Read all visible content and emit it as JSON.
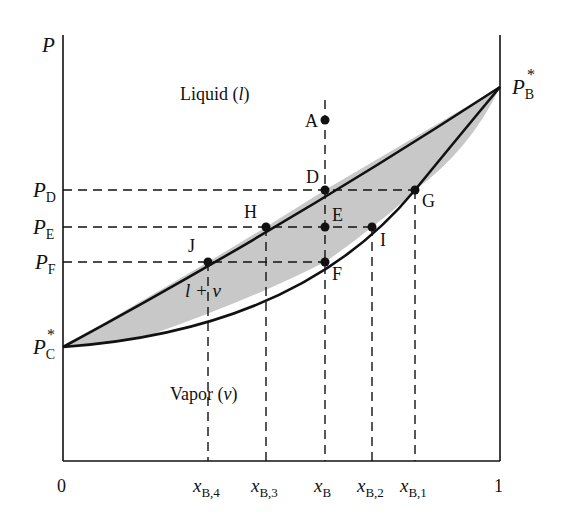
{
  "diagram": {
    "y_axis_label": "P",
    "x_axis_ticks": {
      "left": "0",
      "right": "1"
    },
    "pure_pressures": {
      "P_C_star": {
        "main": "P",
        "sub": "C",
        "sup": "*"
      },
      "P_B_star": {
        "main": "P",
        "sub": "B",
        "sup": "*"
      }
    },
    "pressure_levels": [
      {
        "id": "PD",
        "main": "P",
        "sub": "D"
      },
      {
        "id": "PE",
        "main": "P",
        "sub": "E"
      },
      {
        "id": "PF",
        "main": "P",
        "sub": "F"
      }
    ],
    "composition_labels": [
      {
        "id": "xB4",
        "main": "x",
        "sub": "B,4"
      },
      {
        "id": "xB3",
        "main": "x",
        "sub": "B,3"
      },
      {
        "id": "xB",
        "main": "x",
        "sub": "B"
      },
      {
        "id": "xB2",
        "main": "x",
        "sub": "B,2"
      },
      {
        "id": "xB1",
        "main": "x",
        "sub": "B,1"
      }
    ],
    "points": [
      {
        "id": "A",
        "label": "A"
      },
      {
        "id": "D",
        "label": "D"
      },
      {
        "id": "E",
        "label": "E"
      },
      {
        "id": "F",
        "label": "F"
      },
      {
        "id": "G",
        "label": "G"
      },
      {
        "id": "H",
        "label": "H"
      },
      {
        "id": "I",
        "label": "I"
      },
      {
        "id": "J",
        "label": "J"
      }
    ],
    "regions": {
      "liquid": {
        "text": "Liquid (",
        "sym": "l",
        "close": ")"
      },
      "two_phase": {
        "text": "l + v"
      },
      "vapor": {
        "text": "Vapor (",
        "sym": "v",
        "close": ")"
      }
    },
    "colors": {
      "line": "#111111",
      "fill": "#c8c8c8"
    }
  }
}
